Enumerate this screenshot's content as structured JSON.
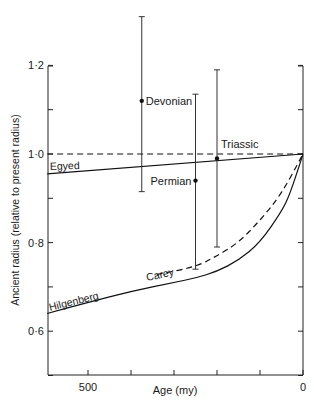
{
  "chart_data": {
    "type": "line",
    "title": "",
    "xlabel": "Age (my)",
    "ylabel": "Ancient radius  (relative to present radius)",
    "xlim": [
      595,
      0
    ],
    "ylim": [
      0.5,
      1.2
    ],
    "x_tick_labels": [
      {
        "value": 500,
        "label": "500"
      },
      {
        "value": 0,
        "label": "0"
      }
    ],
    "x_ticks": [
      500,
      400,
      300,
      200,
      100,
      0
    ],
    "y_tick_labels": [
      {
        "value": 1.2,
        "label": "1·2"
      },
      {
        "value": 1.0,
        "label": "1·0"
      },
      {
        "value": 0.8,
        "label": "0·8"
      },
      {
        "value": 0.6,
        "label": "0·6"
      }
    ],
    "y_ticks": [
      1.2,
      1.1,
      1.0,
      0.9,
      0.8,
      0.7,
      0.6,
      0.5
    ],
    "grid": false,
    "series": [
      {
        "name": "constant radius",
        "style": "dashed",
        "label": "",
        "x": [
          595,
          0
        ],
        "y": [
          1.0,
          1.0
        ]
      },
      {
        "name": "Egyed",
        "style": "solid",
        "label": "Egyed",
        "x": [
          595,
          0
        ],
        "y": [
          0.955,
          1.0
        ]
      },
      {
        "name": "Carey",
        "style": "dashed",
        "label": "Carey",
        "x": [
          340,
          250,
          200,
          150,
          100,
          50,
          0
        ],
        "y": [
          0.728,
          0.745,
          0.77,
          0.8,
          0.85,
          0.91,
          1.0
        ]
      },
      {
        "name": "Hilgenberg",
        "style": "solid",
        "label": "Hilgenberg",
        "x": [
          595,
          500,
          400,
          300,
          250,
          200,
          150,
          100,
          50,
          30,
          0
        ],
        "y": [
          0.64,
          0.665,
          0.69,
          0.71,
          0.72,
          0.735,
          0.76,
          0.8,
          0.87,
          0.91,
          1.0
        ]
      }
    ],
    "points": [
      {
        "name": "Devonian",
        "label": "Devonian",
        "x": 375,
        "y": 1.12,
        "err_high": 1.31,
        "err_low": 0.915
      },
      {
        "name": "Permian",
        "label": "Permian",
        "x": 250,
        "y": 0.94,
        "err_high": 1.135,
        "err_low": 0.74
      },
      {
        "name": "Triassic",
        "label": "Triassic",
        "x": 200,
        "y": 0.99,
        "err_high": 1.19,
        "err_low": 0.79
      }
    ]
  }
}
